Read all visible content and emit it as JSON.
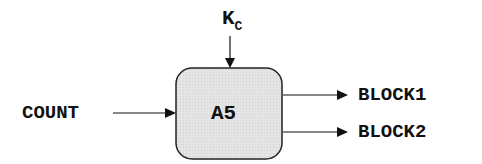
{
  "diagram": {
    "block": {
      "label": "A5",
      "fill": "#e2e2e2",
      "stroke": "#222222"
    },
    "top_input": {
      "label_main": "K",
      "label_sub": "C"
    },
    "left_input": {
      "label": "COUNT"
    },
    "outputs": [
      {
        "label": "BLOCK1"
      },
      {
        "label": "BLOCK2"
      }
    ]
  }
}
